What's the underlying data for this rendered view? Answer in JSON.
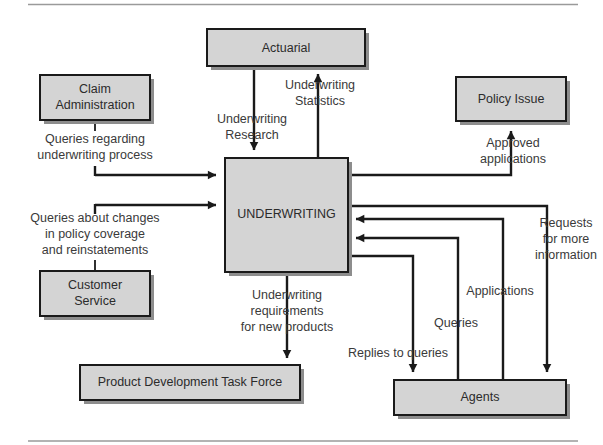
{
  "diagram": {
    "type": "flowchart",
    "colors": {
      "node_fill": "#d4d4d4",
      "node_stroke": "#1a1a1a",
      "node_shadow": "#8d8d8d",
      "arrow": "#1a1a1a",
      "label_text": "#3a3a3a",
      "rule": "#9a9a9a",
      "background": "#ffffff"
    },
    "nodes": [
      {
        "id": "actuarial",
        "label": "Actuarial"
      },
      {
        "id": "claim-administration",
        "label": "Claim\nAdministration"
      },
      {
        "id": "claim-administration-line1",
        "label": "Claim"
      },
      {
        "id": "claim-administration-line2",
        "label": "Administration"
      },
      {
        "id": "policy-issue",
        "label": "Policy Issue"
      },
      {
        "id": "underwriting",
        "label": "UNDERWRITING"
      },
      {
        "id": "customer-service-line1",
        "label": "Customer"
      },
      {
        "id": "customer-service-line2",
        "label": "Service"
      },
      {
        "id": "product-development-task-force",
        "label": "Product Development Task Force"
      },
      {
        "id": "agents",
        "label": "Agents"
      }
    ],
    "flows": [
      {
        "id": "underwriting-research",
        "from": "actuarial",
        "to": "underwriting",
        "label_lines": [
          "Underwriting",
          "Research"
        ]
      },
      {
        "id": "underwriting-statistics",
        "from": "underwriting",
        "to": "actuarial",
        "label_lines": [
          "Underwriting",
          "Statistics"
        ]
      },
      {
        "id": "queries-regarding-underwriting-process",
        "from": "claim-administration",
        "to": "underwriting",
        "label_lines": [
          "Queries regarding",
          "underwriting process"
        ]
      },
      {
        "id": "queries-about-changes",
        "from": "customer-service",
        "to": "underwriting",
        "label_lines": [
          "Queries about changes",
          "in policy coverage",
          "and reinstatements"
        ]
      },
      {
        "id": "approved-applications",
        "from": "underwriting",
        "to": "policy-issue",
        "label_lines": [
          "Approved",
          "applications"
        ]
      },
      {
        "id": "underwriting-requirements",
        "from": "underwriting",
        "to": "product-development-task-force",
        "label_lines": [
          "Underwriting",
          "requirements",
          "for new products"
        ]
      },
      {
        "id": "requests-for-more-information",
        "from": "underwriting",
        "to": "agents",
        "label_lines": [
          "Requests",
          "for more",
          "information"
        ]
      },
      {
        "id": "applications",
        "from": "agents",
        "to": "underwriting",
        "label_lines": [
          "Applications"
        ]
      },
      {
        "id": "queries",
        "from": "agents",
        "to": "underwriting",
        "label_lines": [
          "Queries"
        ]
      },
      {
        "id": "replies-to-queries",
        "from": "underwriting",
        "to": "agents",
        "label_lines": [
          "Replies to queries"
        ]
      }
    ],
    "labels": {
      "actuarial": "Actuarial",
      "claim_admin_l1": "Claim",
      "claim_admin_l2": "Administration",
      "policy_issue": "Policy Issue",
      "underwriting": "UNDERWRITING",
      "customer_service_l1": "Customer",
      "customer_service_l2": "Service",
      "product_dev": "Product Development Task Force",
      "agents": "Agents",
      "uw_research_l1": "Underwriting",
      "uw_research_l2": "Research",
      "uw_stats_l1": "Underwriting",
      "uw_stats_l2": "Statistics",
      "queries_regarding_l1": "Queries regarding",
      "queries_regarding_l2": "underwriting process",
      "queries_changes_l1": "Queries about changes",
      "queries_changes_l2": "in policy coverage",
      "queries_changes_l3": "and reinstatements",
      "approved_apps_l1": "Approved",
      "approved_apps_l2": "applications",
      "uw_req_l1": "Underwriting",
      "uw_req_l2": "requirements",
      "uw_req_l3": "for new products",
      "requests_l1": "Requests",
      "requests_l2": "for more",
      "requests_l3": "information",
      "applications": "Applications",
      "queries": "Queries",
      "replies_to_queries": "Replies to queries"
    }
  }
}
